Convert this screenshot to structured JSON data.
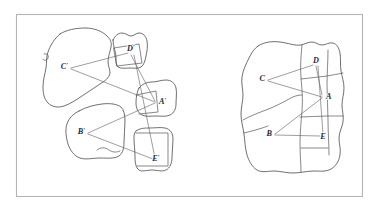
{
  "figure": {
    "frame": {
      "x": 16,
      "y": 14,
      "width": 346,
      "height": 182
    },
    "colors": {
      "background": "#ffffff",
      "frame_stroke": "#b4b4b4",
      "outline_stroke": "#55555c",
      "cut_stroke": "#55555c",
      "connector_stroke": "#5c5c64",
      "label_fill": "#2a2a30"
    },
    "panels": [
      {
        "name": "left-panel",
        "description": "Five separated puzzle pieces with primed vertex labels",
        "labels": [
          {
            "id": "C-prime",
            "text": "C",
            "prime": "′",
            "x": 68,
            "y": 69,
            "anchor": "end"
          },
          {
            "id": "D-prime",
            "text": "D",
            "prime": "′",
            "x": 131,
            "y": 51,
            "anchor": "middle"
          },
          {
            "id": "A-prime",
            "text": "A",
            "prime": "′",
            "x": 159,
            "y": 104,
            "anchor": "start"
          },
          {
            "id": "B-prime",
            "text": "B",
            "prime": "′",
            "x": 85,
            "y": 134,
            "anchor": "end"
          },
          {
            "id": "E-prime",
            "text": "E",
            "prime": "′",
            "x": 156,
            "y": 161,
            "anchor": "middle"
          }
        ],
        "connectors": [
          {
            "from": "C-prime",
            "to": "D-prime"
          },
          {
            "from": "C-prime",
            "to": "A-prime"
          },
          {
            "from": "D-prime",
            "to": "A-prime"
          },
          {
            "from": "D-prime",
            "to": "E-prime"
          },
          {
            "from": "B-prime",
            "to": "A-prime"
          },
          {
            "from": "B-prime",
            "to": "E-prime"
          }
        ]
      },
      {
        "name": "right-panel",
        "description": "The same five pieces assembled into one closed figure, unprimed vertex labels",
        "labels": [
          {
            "id": "C",
            "text": "C",
            "prime": "",
            "x": 265,
            "y": 81,
            "anchor": "end"
          },
          {
            "id": "D",
            "text": "D",
            "prime": "",
            "x": 316,
            "y": 63,
            "anchor": "middle"
          },
          {
            "id": "A",
            "text": "A",
            "prime": "",
            "x": 326,
            "y": 99,
            "anchor": "start"
          },
          {
            "id": "B",
            "text": "B",
            "prime": "",
            "x": 272,
            "y": 136,
            "anchor": "end"
          },
          {
            "id": "E",
            "text": "E",
            "prime": "",
            "x": 323,
            "y": 139,
            "anchor": "middle"
          }
        ],
        "connectors": [
          {
            "from": "C",
            "to": "D"
          },
          {
            "from": "C",
            "to": "A"
          },
          {
            "from": "D",
            "to": "A"
          },
          {
            "from": "D",
            "to": "E"
          },
          {
            "from": "B",
            "to": "A"
          },
          {
            "from": "B",
            "to": "E"
          }
        ]
      }
    ]
  }
}
